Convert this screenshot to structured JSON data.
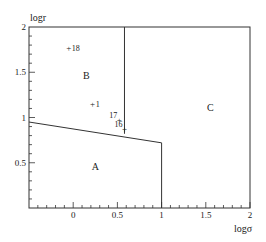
{
  "chart_data": {
    "type": "scatter",
    "title": "",
    "xlabel": "logσ",
    "ylabel": "logr",
    "xlim": [
      -0.5,
      2
    ],
    "ylim": [
      0,
      2
    ],
    "x_ticks": [
      "0",
      "0.5",
      "1",
      "1.5",
      "2"
    ],
    "y_ticks": [
      "0.5",
      "1",
      "1.5",
      "2"
    ],
    "grid": false,
    "regions": [
      {
        "label": "A",
        "x": 0.25,
        "y": 0.42
      },
      {
        "label": "B",
        "x": 0.15,
        "y": 1.43
      },
      {
        "label": "C",
        "x": 1.55,
        "y": 1.07
      }
    ],
    "boundaries": [
      {
        "name": "A-B boundary",
        "points": [
          [
            -0.5,
            0.95
          ],
          [
            1.0,
            0.72
          ]
        ]
      },
      {
        "name": "B-C boundary",
        "points": [
          [
            0.58,
            0.82
          ],
          [
            0.58,
            2.0
          ]
        ]
      },
      {
        "name": "A-C boundary",
        "points": [
          [
            1.0,
            0.72
          ],
          [
            1.0,
            0.0
          ]
        ]
      }
    ],
    "points": [
      {
        "label": "18",
        "x": -0.05,
        "y": 1.77
      },
      {
        "label": "1",
        "x": 0.22,
        "y": 1.15
      },
      {
        "label": "17",
        "x": 0.52,
        "y": 0.97
      },
      {
        "label": "16",
        "x": 0.58,
        "y": 0.87
      }
    ]
  }
}
